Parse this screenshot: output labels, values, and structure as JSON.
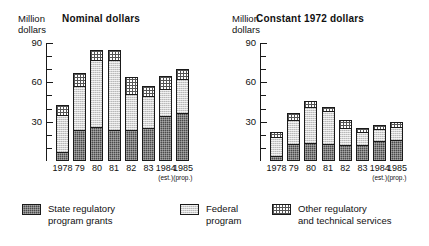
{
  "figure": {
    "axis_caption": "Million\ndollars",
    "y_ticks_major": [
      30,
      60,
      90
    ],
    "y_ticks_minor": [
      10,
      20,
      40,
      50,
      70,
      80
    ],
    "ylim": [
      0,
      90
    ]
  },
  "legend": {
    "items": [
      {
        "key": "state",
        "label": "State regulatory\nprogram grants",
        "color": "#4a4a4a",
        "pattern": "dark-crosshatch"
      },
      {
        "key": "federal",
        "label": "Federal\nprogram",
        "color": "#d2d2d2",
        "pattern": "light-stipple"
      },
      {
        "key": "other",
        "label": "Other regulatory\nand technical services",
        "color": "#ffffff",
        "pattern": "dotted-grid"
      }
    ]
  },
  "chart_data": [
    {
      "id": "nominal",
      "type": "bar",
      "subtype": "stacked",
      "title": "Nominal dollars",
      "xlabel": "",
      "ylabel": "Million dollars",
      "ylim": [
        0,
        90
      ],
      "grid": false,
      "legend_position": "bottom",
      "categories": [
        "1978",
        "79",
        "80",
        "81",
        "82",
        "83",
        "1984",
        "1985"
      ],
      "category_notes": [
        "",
        "",
        "",
        "",
        "",
        "",
        "(est.)",
        "(prop.)"
      ],
      "series": [
        {
          "name": "State regulatory program grants",
          "values": [
            7,
            24,
            26,
            24,
            24,
            25,
            34,
            37
          ]
        },
        {
          "name": "Federal program",
          "values": [
            29,
            34,
            52,
            54,
            28,
            25,
            22,
            26
          ]
        },
        {
          "name": "Other regulatory and technical services",
          "values": [
            8,
            11,
            8,
            8,
            14,
            9,
            10,
            9
          ]
        }
      ],
      "totals": [
        44,
        69,
        86,
        86,
        66,
        59,
        66,
        72
      ]
    },
    {
      "id": "constant",
      "type": "bar",
      "subtype": "stacked",
      "title": "Constant 1972 dollars",
      "xlabel": "",
      "ylabel": "Million dollars",
      "ylim": [
        0,
        90
      ],
      "grid": false,
      "legend_position": "bottom",
      "categories": [
        "1978",
        "79",
        "80",
        "81",
        "82",
        "83",
        "1984",
        "1985"
      ],
      "category_notes": [
        "",
        "",
        "",
        "",
        "",
        "",
        "(est.)",
        "(prop.)"
      ],
      "series": [
        {
          "name": "State regulatory program grants",
          "values": [
            4,
            13,
            14,
            13,
            12,
            12,
            15,
            16
          ]
        },
        {
          "name": "Federal program",
          "values": [
            15,
            19,
            28,
            26,
            14,
            11,
            10,
            11
          ]
        },
        {
          "name": "Other regulatory and technical services",
          "values": [
            5,
            6,
            5,
            4,
            7,
            4,
            4,
            4
          ]
        }
      ],
      "totals": [
        24,
        38,
        47,
        43,
        33,
        27,
        29,
        31
      ]
    }
  ]
}
